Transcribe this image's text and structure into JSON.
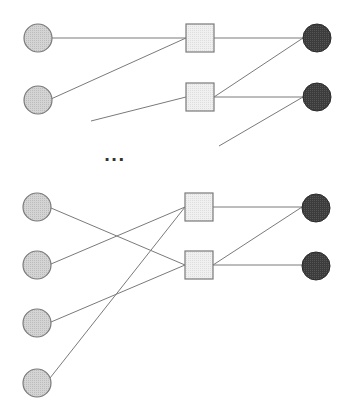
{
  "diagram": {
    "type": "bipartite-network",
    "colors": {
      "edge": "#7a7a7a",
      "input_fill": "#cfcfcf",
      "input_stroke": "#7a7a7a",
      "hidden_fill": "#ececec",
      "hidden_stroke": "#7a7a7a",
      "output_fill": "#3a3a3a",
      "output_stroke": "#2a2a2a"
    },
    "ellipsis": "...",
    "groups": [
      {
        "name": "top-group",
        "input_nodes": [
          {
            "id": "in-1",
            "cx": 38,
            "cy": 38,
            "r": 14
          },
          {
            "id": "in-2",
            "cx": 38,
            "cy": 100,
            "r": 14
          }
        ],
        "hidden_nodes": [
          {
            "id": "sq-1",
            "x": 186,
            "y": 24,
            "w": 28,
            "h": 28
          },
          {
            "id": "sq-2",
            "x": 186,
            "y": 83,
            "w": 28,
            "h": 28
          }
        ],
        "output_nodes": [
          {
            "id": "out-1",
            "cx": 317,
            "cy": 38,
            "r": 14
          },
          {
            "id": "out-2",
            "cx": 317,
            "cy": 97,
            "r": 14
          }
        ]
      },
      {
        "name": "bottom-group",
        "input_nodes": [
          {
            "id": "in-3",
            "cx": 37,
            "cy": 207,
            "r": 14
          },
          {
            "id": "in-4",
            "cx": 37,
            "cy": 265,
            "r": 14
          },
          {
            "id": "in-5",
            "cx": 37,
            "cy": 323,
            "r": 14
          },
          {
            "id": "in-6",
            "cx": 37,
            "cy": 383,
            "r": 14
          }
        ],
        "hidden_nodes": [
          {
            "id": "sq-3",
            "x": 185,
            "y": 193,
            "w": 28,
            "h": 28
          },
          {
            "id": "sq-4",
            "x": 185,
            "y": 251,
            "w": 28,
            "h": 28
          }
        ],
        "output_nodes": [
          {
            "id": "out-3",
            "cx": 316,
            "cy": 208,
            "r": 14
          },
          {
            "id": "out-4",
            "cx": 316,
            "cy": 266,
            "r": 14
          }
        ]
      }
    ],
    "edges": [
      {
        "from": "in-1",
        "to": "sq-1",
        "x1": 52,
        "y1": 38,
        "x2": 186,
        "y2": 38
      },
      {
        "from": "in-2",
        "to": "sq-1",
        "x1": 51,
        "y1": 99,
        "x2": 186,
        "y2": 38
      },
      {
        "from": "partial",
        "to": "sq-2",
        "x1": 91,
        "y1": 121,
        "x2": 186,
        "y2": 97
      },
      {
        "from": "sq-1",
        "to": "out-1",
        "x1": 214,
        "y1": 38,
        "x2": 303,
        "y2": 38
      },
      {
        "from": "sq-2",
        "to": "out-1",
        "x1": 214,
        "y1": 97,
        "x2": 303,
        "y2": 38
      },
      {
        "from": "sq-2",
        "to": "out-2",
        "x1": 214,
        "y1": 97,
        "x2": 303,
        "y2": 97
      },
      {
        "from": "partial",
        "to": "out-2",
        "x1": 219,
        "y1": 146,
        "x2": 303,
        "y2": 97
      },
      {
        "from": "in-3",
        "to": "sq-4",
        "x1": 51,
        "y1": 208,
        "x2": 185,
        "y2": 265
      },
      {
        "from": "in-4",
        "to": "sq-3",
        "x1": 51,
        "y1": 264,
        "x2": 185,
        "y2": 207
      },
      {
        "from": "in-5",
        "to": "sq-4",
        "x1": 51,
        "y1": 322,
        "x2": 185,
        "y2": 265
      },
      {
        "from": "in-6",
        "to": "sq-3",
        "x1": 50,
        "y1": 378,
        "x2": 185,
        "y2": 207
      },
      {
        "from": "sq-3",
        "to": "out-3",
        "x1": 213,
        "y1": 207,
        "x2": 302,
        "y2": 207
      },
      {
        "from": "sq-4",
        "to": "out-3",
        "x1": 213,
        "y1": 265,
        "x2": 302,
        "y2": 207
      },
      {
        "from": "sq-4",
        "to": "out-4",
        "x1": 213,
        "y1": 265,
        "x2": 302,
        "y2": 265
      }
    ]
  }
}
